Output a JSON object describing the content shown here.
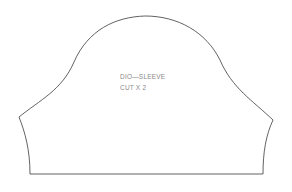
{
  "pattern_piece": {
    "name": "DIO—SLEEVE",
    "instruction": "CUT X 2",
    "outline_color": "#3a3a3a",
    "text_color": "#8a8a8a",
    "background": "#ffffff"
  }
}
